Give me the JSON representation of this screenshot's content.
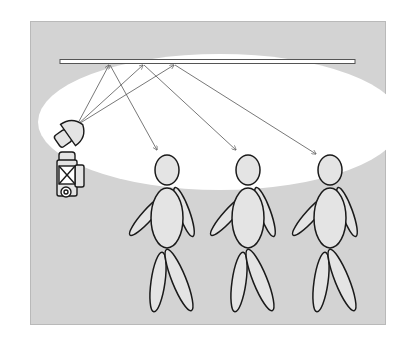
{
  "diagram": {
    "colors": {
      "page_background": "#ffffff",
      "panel_background": "#d3d3d3",
      "light_spill": "#ffffff",
      "figure_fill": "#e4e4e4",
      "outline": "#1a1a1a",
      "arrow": "#555555",
      "ceiling_fill": "#ffffff",
      "ceiling_stroke": "#555555"
    },
    "elements": {
      "ceiling": "ceiling-reflector",
      "flash": "flash-head",
      "camera": "camera-body",
      "subjects": [
        "person-1",
        "person-2",
        "person-3"
      ],
      "ray_count": 6
    }
  }
}
